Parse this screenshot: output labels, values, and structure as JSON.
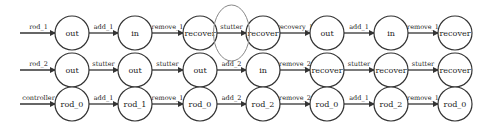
{
  "diagram": {
    "highlight_color": "#888888",
    "rows": [
      {
        "input_label": "rod_1",
        "nodes": [
          "out",
          "in",
          "recover",
          "recover",
          "out",
          "in",
          "recover"
        ],
        "edges": [
          "add_1",
          "remove_1",
          "stutter",
          "recovery_1",
          "add_1",
          "remove_1"
        ]
      },
      {
        "input_label": "rod_2",
        "nodes": [
          "out",
          "out",
          "out",
          "in",
          "recover",
          "recover",
          "recover"
        ],
        "edges": [
          "stutter",
          "stutter",
          "add_2",
          "remove_2",
          "stutter",
          "stutter"
        ]
      },
      {
        "input_label": "controller",
        "nodes": [
          "rod_0",
          "rod_1",
          "rod_0",
          "rod_2",
          "rod_0",
          "rod_2",
          "rod_0"
        ],
        "edges": [
          "add_1",
          "remove_1",
          "add_2",
          "remove_2",
          "add_1",
          "remove_1"
        ]
      }
    ],
    "highlighted_edge": {
      "row": 0,
      "index": 2,
      "label": "stutter"
    }
  }
}
